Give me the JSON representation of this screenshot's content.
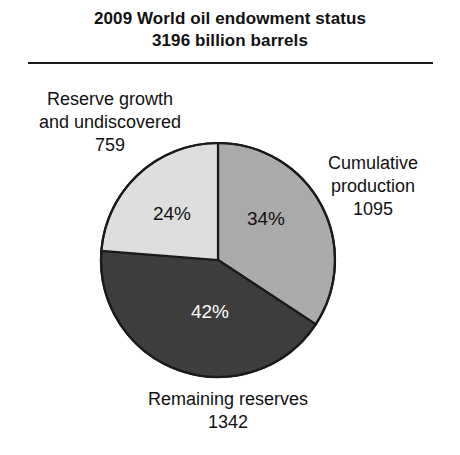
{
  "figure": {
    "title_line1": "2009 World oil endowment status",
    "title_line2": "3196 billion barrels"
  },
  "labels": {
    "reserve_growth": {
      "line1": "Reserve growth",
      "line2": "and undiscovered",
      "value": "759",
      "percent": "24%"
    },
    "cumulative_production": {
      "line1": "Cumulative",
      "line2": "production",
      "value": "1095",
      "percent": "34%"
    },
    "remaining_reserves": {
      "line1": "Remaining reserves",
      "line2": "",
      "value": "1342",
      "percent": "42%"
    }
  },
  "colors": {
    "cumulative_production": "#ababab",
    "remaining_reserves": "#3d3d3d",
    "reserve_growth": "#dedede",
    "outline": "#1a1a1a",
    "text": "#111111",
    "text_on_dark": "#ffffff",
    "background": "#ffffff"
  },
  "chart_data": {
    "type": "pie",
    "title": "2009 World oil endowment status 3196 billion barrels",
    "unit": "billion barrels",
    "total": 3196,
    "start_angle_deg": 0,
    "direction": "clockwise",
    "grid": false,
    "legend": "none",
    "labels": [
      "Cumulative production",
      "Remaining reserves",
      "Reserve growth and undiscovered"
    ],
    "values": [
      1095,
      1342,
      759
    ],
    "percentages": [
      34,
      42,
      24
    ],
    "percent_labels": [
      "34%",
      "42%",
      "24%"
    ],
    "slice_colors": [
      "#ababab",
      "#3d3d3d",
      "#dedede"
    ],
    "slices": [
      {
        "name": "Cumulative production",
        "value": 1095,
        "percent": 34,
        "percent_label": "34%",
        "color": "#ababab",
        "start_deg": 0,
        "end_deg": 123.4
      },
      {
        "name": "Remaining reserves",
        "value": 1342,
        "percent": 42,
        "percent_label": "42%",
        "color": "#3d3d3d",
        "start_deg": 123.4,
        "end_deg": 274.6
      },
      {
        "name": "Reserve growth and undiscovered",
        "value": 759,
        "percent": 24,
        "percent_label": "24%",
        "color": "#dedede",
        "start_deg": 274.6,
        "end_deg": 360
      }
    ]
  }
}
